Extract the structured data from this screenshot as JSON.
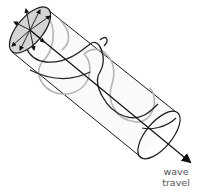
{
  "figure": {
    "type": "circularly polarized wave diagram",
    "label_line1": "wave",
    "label_line2": "travel"
  },
  "colors": {
    "outline": "#1a1a1a",
    "helix_dark": "#222222",
    "helix_light": "#b5b5b5",
    "end_cap_fill": "#d4d4d4",
    "body_fill": "#fafafa",
    "label": "#555555"
  }
}
